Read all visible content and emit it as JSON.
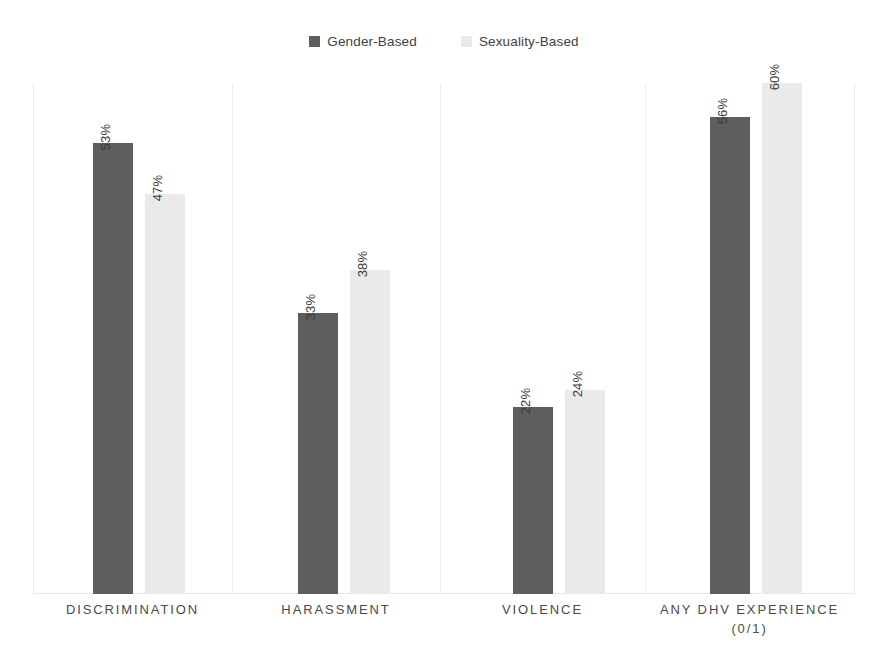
{
  "legend": {
    "position": "top-center",
    "entries": [
      {
        "label": "Gender-Based",
        "color": "#5e5e5e",
        "icon": "legend-swatch"
      },
      {
        "label": "Sexuality-Based",
        "color": "#eaeaea",
        "icon": "legend-swatch"
      }
    ]
  },
  "chart_data": {
    "type": "bar",
    "title": "",
    "subtitle": "",
    "xlabel": "",
    "ylabel": "",
    "ylim": [
      0,
      60
    ],
    "grid": false,
    "legend_position": "top-center",
    "categories": [
      "DISCRIMINATION",
      "HARASSMENT",
      "VIOLENCE",
      "ANY DHV EXPERIENCE\n(0/1)"
    ],
    "series": [
      {
        "name": "Gender-Based",
        "color": "#5e5e5e",
        "values": [
          53,
          33,
          22,
          56
        ],
        "labels": [
          "53%",
          "33%",
          "22%",
          "56%"
        ]
      },
      {
        "name": "Sexuality-Based",
        "color": "#eaeaea",
        "values": [
          47,
          38,
          24,
          60
        ],
        "labels": [
          "47%",
          "38%",
          "24%",
          "60%"
        ]
      }
    ]
  },
  "axes": {
    "frame_color": "#ededed",
    "baseline_color": "#e6e6e6"
  }
}
